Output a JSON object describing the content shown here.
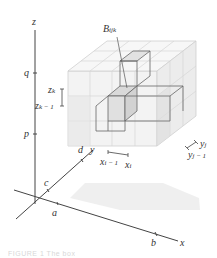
{
  "figure": {
    "type": "3D Riemann sum box diagram",
    "axes": {
      "x_label": "x",
      "y_label": "y",
      "z_label": "z"
    },
    "ticks": {
      "x": [
        "a",
        "b"
      ],
      "y": [
        "c",
        "d"
      ],
      "z": [
        "p",
        "q"
      ]
    },
    "subbox_label": "B",
    "subbox_subscript": "ijk",
    "interval_labels": {
      "z_upper": "z",
      "z_upper_sub": "k",
      "z_lower": "z",
      "z_lower_sub": "k − 1",
      "x_lower": "x",
      "x_lower_sub": "i − 1",
      "x_upper": "x",
      "x_upper_sub": "i",
      "y_upper": "y",
      "y_upper_sub": "j",
      "y_lower": "y",
      "y_lower_sub": "j − 1"
    },
    "caption": "FIGURE 1  The box"
  },
  "colors": {
    "axis": "#333333",
    "grid": "#c8c8c8",
    "face_light": "#f2f2f2",
    "face_shade": "#e4e4e4",
    "highlight_line": "#555555",
    "shadow": "#ececec"
  }
}
